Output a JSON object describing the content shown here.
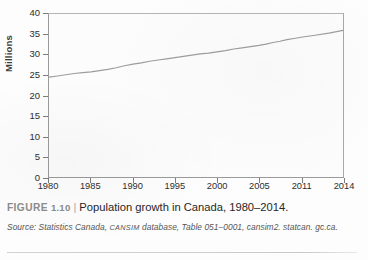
{
  "figure": {
    "label_prefix": "FIGURE",
    "number": "1.10",
    "separator": "|",
    "title": "Population growth in Canada, 1980–2014.",
    "source_prefix": "Source:",
    "source_part1": "Statistics Canada,",
    "source_smallcaps": "CANSIM",
    "source_part2": "database, Table 051–0001, cansim2. statcan.",
    "source_part3": "gc.ca."
  },
  "chart_data": {
    "type": "line",
    "title": "Population growth in Canada, 1980–2014",
    "xlabel": "",
    "ylabel": "Millions",
    "ylim": [
      0,
      40
    ],
    "yticks": [
      0,
      5,
      10,
      15,
      20,
      25,
      30,
      35,
      40
    ],
    "xticks": [
      "1980",
      "1985",
      "1990",
      "1995",
      "2000",
      "2005",
      "2011",
      "2014"
    ],
    "grid": false,
    "legend": "none",
    "line_color": "#9d9d9d",
    "x": [
      1980,
      1981,
      1982,
      1983,
      1984,
      1985,
      1986,
      1987,
      1988,
      1989,
      1990,
      1991,
      1992,
      1993,
      1994,
      1995,
      1996,
      1997,
      1998,
      1999,
      2000,
      2001,
      2002,
      2003,
      2004,
      2005,
      2006,
      2007,
      2008,
      2009,
      2010,
      2011,
      2012,
      2013,
      2014
    ],
    "values": [
      24.5,
      24.8,
      25.1,
      25.4,
      25.6,
      25.8,
      26.1,
      26.4,
      26.8,
      27.3,
      27.7,
      28.0,
      28.4,
      28.7,
      29.0,
      29.3,
      29.6,
      29.9,
      30.2,
      30.4,
      30.7,
      31.0,
      31.4,
      31.7,
      32.0,
      32.3,
      32.6,
      33.0,
      33.3,
      33.7,
      34.0,
      34.3,
      34.8,
      35.3,
      36.0
    ],
    "y_start_value": 24.5,
    "y_end_value": 36.0,
    "x_start": "1980",
    "x_end": "2014"
  }
}
